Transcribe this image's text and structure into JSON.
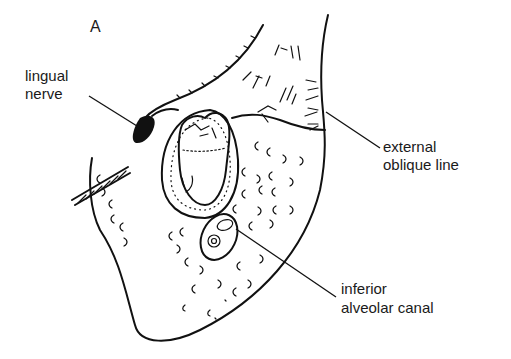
{
  "figure": {
    "panel_letter": "A",
    "labels": {
      "lingual_nerve": [
        "lingual",
        "nerve"
      ],
      "external_oblique_line": [
        "external",
        "oblique line"
      ],
      "inferior_alveolar_canal": [
        "inferior",
        "alveolar canal"
      ]
    },
    "colors": {
      "ink": "#111111",
      "background": "#ffffff"
    }
  }
}
